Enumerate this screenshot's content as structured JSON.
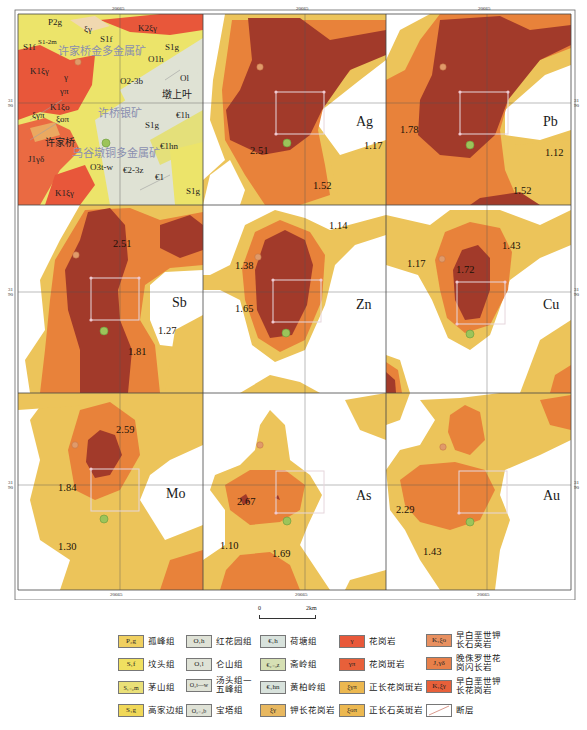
{
  "figure": {
    "type": "geochemical anomaly map grid",
    "coordinate_ticks": {
      "top": [
        "20665",
        "20665"
      ],
      "bottom": [
        "20665",
        "20665",
        "20665"
      ],
      "left": [
        "31\n90",
        "31\n90",
        "31\n90"
      ],
      "right": [
        "31\n90",
        "31\n90",
        "31\n90"
      ]
    },
    "geology_panel": {
      "unit_labels": [
        "P2g",
        "ξγ",
        "S1f",
        "K2ξγ",
        "S1f",
        "S1-2m",
        "S1g",
        "O1h",
        "K1ξγ",
        "γ",
        "O2-3b",
        "Ol",
        "γπ",
        "K1ξo",
        "ξγπ",
        "ξoπ",
        "€1h",
        "S1g",
        "€1hn",
        "J1γδ",
        "O3t-w",
        "€2-3z",
        "€1",
        "K1ξγ",
        "S1g"
      ],
      "deposits": [
        "许家桥金多金属矿",
        "许桥银矿",
        "乌谷墩铜多金属矿"
      ],
      "towns": [
        "墩上叶",
        "许家桥"
      ]
    },
    "panels": [
      {
        "element": "Ag",
        "values": [
          "2.51",
          "1.17",
          "1.52"
        ]
      },
      {
        "element": "Pb",
        "values": [
          "1.78",
          "1.12",
          "1.52"
        ]
      },
      {
        "element": "Sb",
        "values": [
          "2.51",
          "1.27",
          "1.81"
        ]
      },
      {
        "element": "Zn",
        "values": [
          "1.14",
          "1.38",
          "1.65"
        ]
      },
      {
        "element": "Cu",
        "values": [
          "1.43",
          "1.17",
          "1.72"
        ]
      },
      {
        "element": "Mo",
        "values": [
          "2.59",
          "1.84",
          "1.30"
        ]
      },
      {
        "element": "As",
        "values": [
          "2.67",
          "1.10",
          "1.69"
        ]
      },
      {
        "element": "Au",
        "values": [
          "2.29",
          "1.43"
        ]
      }
    ],
    "colors": {
      "outer_zone": "#ecc45a",
      "middle_zone": "#e8823a",
      "inner_zone": "#a23a2a",
      "white": "#ffffff",
      "grid_line": "#555555",
      "deposit_marker": "#9cc45a",
      "town_marker": "#e09060"
    }
  },
  "scale_bar": {
    "start": "0",
    "end": "2km"
  },
  "legend": {
    "items": [
      {
        "symbol": "P₂g",
        "label": "孤峰组",
        "color": "#f0d060"
      },
      {
        "symbol": "S₁f",
        "label": "坟头组",
        "color": "#f0e060"
      },
      {
        "symbol": "S₁₋₂m",
        "label": "茅山组",
        "color": "#eae078"
      },
      {
        "symbol": "S₁g",
        "label": "高家边组",
        "color": "#f0d858"
      },
      {
        "symbol": "O₁h",
        "label": "红花园组",
        "color": "#dfe2d6"
      },
      {
        "symbol": "O₁l",
        "label": "仑山组",
        "color": "#dfe2d6"
      },
      {
        "symbol": "O₃t—w",
        "label": "汤头组—五峰组",
        "color": "#dfe2d6"
      },
      {
        "symbol": "O₂₋₃b",
        "label": "宝塔组",
        "color": "#dfe2d6"
      },
      {
        "symbol": "€₁h",
        "label": "荷塘组",
        "color": "#d8e2dc"
      },
      {
        "symbol": "€₂₋₃z",
        "label": "斋岭组",
        "color": "#d6e0b4"
      },
      {
        "symbol": "€₁hn",
        "label": "黄柏岭组",
        "color": "#d8e2dc"
      },
      {
        "symbol": "ξγ",
        "label": "钾长花岗岩",
        "color": "#e8b860"
      },
      {
        "symbol": "γ",
        "label": "花岗岩",
        "color": "#e8583a"
      },
      {
        "symbol": "γπ",
        "label": "花岗斑岩",
        "color": "#e8603a"
      },
      {
        "symbol": "ξγπ",
        "label": "正长花岗斑岩",
        "color": "#ecb850"
      },
      {
        "symbol": "ξoπ",
        "label": "正长石英斑岩",
        "color": "#ecb850"
      },
      {
        "symbol": "K₁ξo",
        "label": "早白垩世钾长石英岩",
        "color": "#e89060"
      },
      {
        "symbol": "J₁γδ",
        "label": "晚侏罗世花岗闪长岩",
        "color": "#e8804a"
      },
      {
        "symbol": "K₁ξγ",
        "label": "早白垩世钾长花岗岩",
        "color": "#e8603a"
      },
      {
        "symbol": "",
        "label": "断层",
        "color": "#ffffff"
      }
    ]
  }
}
